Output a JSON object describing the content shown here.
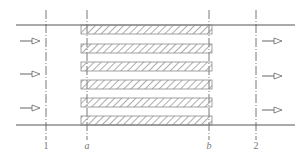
{
  "diagram": {
    "title": "",
    "colors": {
      "line": "#555555",
      "hatch": "#8a8a8a",
      "arrow": "#666666",
      "label": "#777777"
    },
    "walls": {
      "top_y": 25,
      "bottom_y": 125,
      "x_start": 16,
      "x_end": 295
    },
    "sections": [
      {
        "id": "1",
        "label": "1",
        "x": 46
      },
      {
        "id": "a",
        "label": "a",
        "x": 87
      },
      {
        "id": "b",
        "label": "b",
        "x": 209
      },
      {
        "id": "2",
        "label": "2",
        "x": 256
      }
    ],
    "plates": {
      "count": 6,
      "x_start": 81,
      "x_end": 212,
      "height": 9,
      "tops": [
        25,
        44,
        62,
        80,
        98,
        116
      ]
    },
    "inlet_arrows": {
      "direction": "right",
      "x_start": 20,
      "x_end": 40,
      "ys": [
        41,
        74,
        108
      ]
    },
    "outlet_arrows": {
      "direction": "right",
      "x_start": 262,
      "x_end": 282,
      "ys": [
        41,
        76,
        110
      ]
    },
    "labels": {
      "section_1": "1",
      "section_a": "a",
      "section_b": "b",
      "section_2": "2"
    }
  }
}
